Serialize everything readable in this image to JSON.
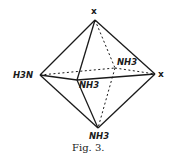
{
  "figure": {
    "caption": "Fig. 3.",
    "shape": "octahedron",
    "vertices": {
      "top": {
        "label": "x",
        "x": 95,
        "y": 20
      },
      "left": {
        "label": "H3N",
        "x": 40,
        "y": 75
      },
      "right": {
        "label": "x",
        "x": 155,
        "y": 74
      },
      "front": {
        "label": "NH3",
        "x": 77,
        "y": 80
      },
      "back": {
        "label": "NH3",
        "x": 115,
        "y": 68
      },
      "bottom": {
        "label": "NH3",
        "x": 98,
        "y": 128
      }
    },
    "edges_solid": [
      [
        "top",
        "left"
      ],
      [
        "top",
        "right"
      ],
      [
        "top",
        "front"
      ],
      [
        "left",
        "front"
      ],
      [
        "front",
        "right"
      ],
      [
        "left",
        "bottom"
      ],
      [
        "front",
        "bottom"
      ],
      [
        "right",
        "bottom"
      ]
    ],
    "edges_dashed": [
      [
        "top",
        "back"
      ],
      [
        "left",
        "back"
      ],
      [
        "back",
        "right"
      ],
      [
        "back",
        "bottom"
      ]
    ],
    "diagonals_dashed": [
      [
        "left",
        "right"
      ]
    ],
    "text_color": "#1a1a1a",
    "background": "#ffffff"
  }
}
